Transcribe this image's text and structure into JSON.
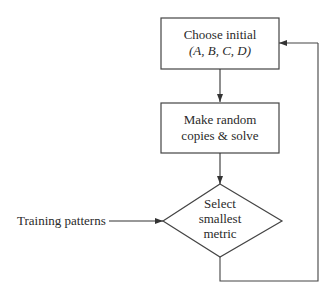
{
  "diagram": {
    "type": "flowchart",
    "nodes": [
      {
        "id": "choose",
        "shape": "rectangle",
        "line1": "Choose initial",
        "line2": "(A, B, C, D)"
      },
      {
        "id": "make",
        "shape": "rectangle",
        "line1": "Make random",
        "line2": "copies & solve"
      },
      {
        "id": "select",
        "shape": "diamond",
        "line1": "Select",
        "line2": "smallest",
        "line3": "metric"
      }
    ],
    "inputs": [
      {
        "id": "training",
        "label": "Training patterns",
        "target": "select"
      }
    ],
    "edges": [
      {
        "from": "choose",
        "to": "make"
      },
      {
        "from": "make",
        "to": "select"
      },
      {
        "from": "training",
        "to": "select"
      },
      {
        "from": "select",
        "to": "choose",
        "route": "feedback-loop-right"
      }
    ],
    "colors": {
      "stroke": "#333333",
      "background": "#ffffff"
    }
  }
}
